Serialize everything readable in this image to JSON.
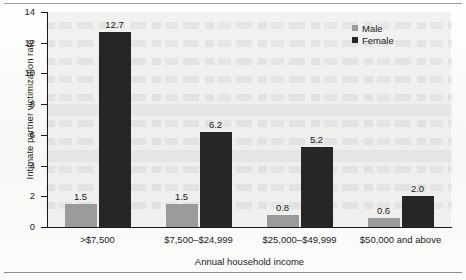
{
  "chart_data": {
    "type": "bar",
    "title": "",
    "subtitle": "",
    "xlabel": "Annual household income",
    "ylabel": "Intimate partner victimization rate",
    "categories": [
      ">$7,500",
      "$7,500–$24,999",
      "$25,000–$49,999",
      "$50,000 and above"
    ],
    "series": [
      {
        "name": "Male",
        "color": "#9b9b9b",
        "values": [
          1.5,
          1.5,
          0.8,
          0.6
        ],
        "labels": [
          "1.5",
          "1.5",
          "0.8",
          "0.6"
        ]
      },
      {
        "name": "Female",
        "color": "#262626",
        "values": [
          12.7,
          6.2,
          5.2,
          2.0
        ],
        "labels": [
          "12.7",
          "6.2",
          "5.2",
          "2.0"
        ]
      }
    ],
    "ylim": [
      0,
      14
    ],
    "yticks": [
      0,
      2,
      4,
      6,
      8,
      10,
      12,
      14
    ],
    "ytick_labels": [
      "0",
      "2",
      "4",
      "6",
      "8",
      "10",
      "12",
      "14"
    ],
    "grid": false,
    "legend_position": "top-right",
    "legend_entries": [
      "Male",
      "Female"
    ],
    "plot_background": "#e8e8e6"
  }
}
